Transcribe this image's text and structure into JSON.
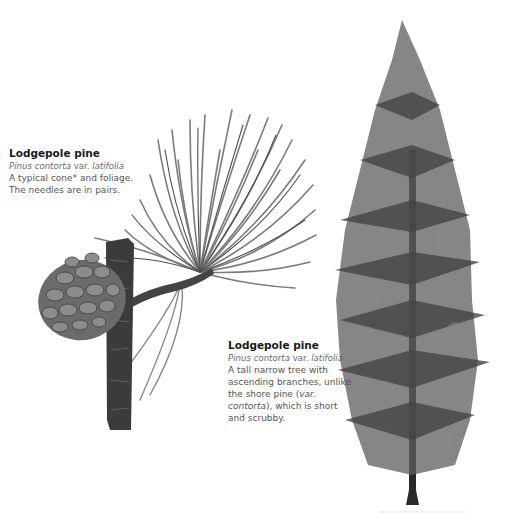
{
  "captions": {
    "branch": {
      "title": "Lodgepole pine",
      "latin_prefix": "Pinus contorta",
      "latin_var": " var. ",
      "latin_suffix": "latifolia",
      "line1": "A typical cone* and foliage.",
      "line2": "The needles are in pairs."
    },
    "tree": {
      "title": "Lodgepole pine",
      "latin_prefix": "Pinus contorta",
      "latin_var": " var. ",
      "latin_suffix": "latifolia",
      "line1": "A tall narrow tree with",
      "line2": "ascending branches, unlike",
      "line3a": "the shore pine (",
      "line3b": "var.",
      "line4a": "contorta",
      "line4b": "), which is short",
      "line5": "and scrubby."
    }
  },
  "illustrations": {
    "branch": "pine-branch-with-cone",
    "tree": "lodgepole-pine-tree"
  },
  "colors": {
    "needle": "#7a7a7a",
    "needle_dark": "#4a4a4a",
    "bark": "#3a3a3a",
    "cone": "#6e6e6e",
    "foliage": "#5a5a5a",
    "trunk": "#222222"
  }
}
